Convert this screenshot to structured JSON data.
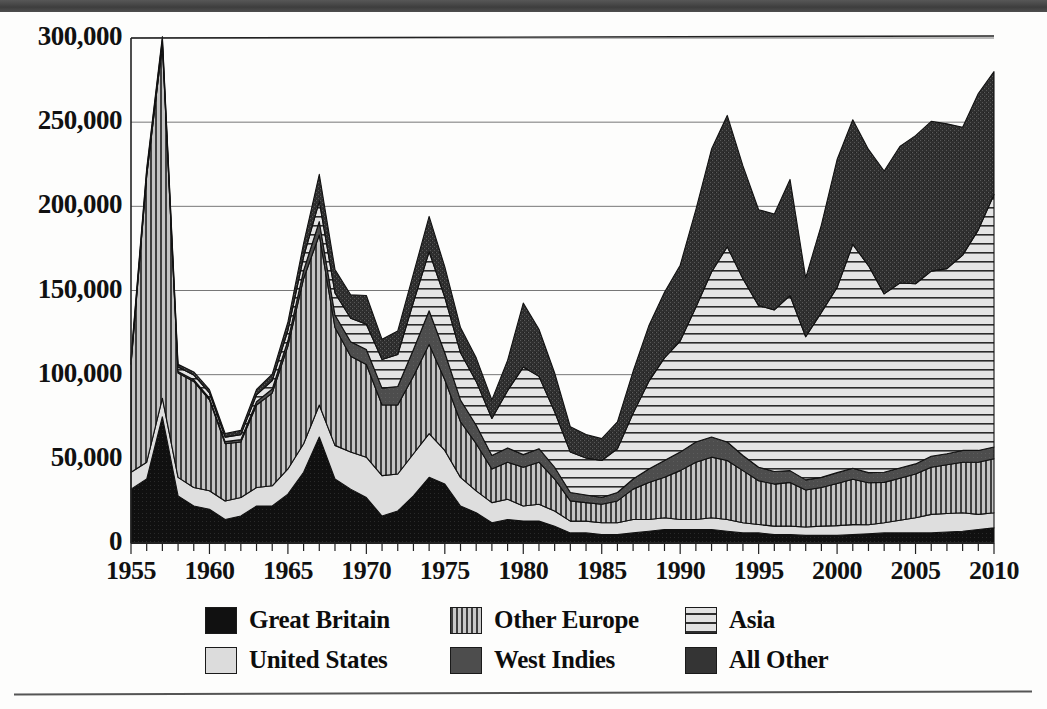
{
  "figure": {
    "banner_present": true,
    "background_color": "#fdfdfc",
    "accent_color": "#4a4a4a"
  },
  "chart_data": {
    "type": "area",
    "stacked": true,
    "title": "",
    "subtitle": "",
    "xlabel": "",
    "ylabel": "",
    "xlim": [
      1955,
      2010
    ],
    "ylim": [
      0,
      300000
    ],
    "grid": true,
    "grid_axis": "y",
    "legend_position": "bottom",
    "x_tick_labels": [
      "1955",
      "1960",
      "1965",
      "1970",
      "1975",
      "1980",
      "1985",
      "1990",
      "1995",
      "2000",
      "2005",
      "2010"
    ],
    "x_tick_step": 5,
    "minor_tick_step": 1,
    "y_tick_labels": [
      "0",
      "50,000",
      "100,000",
      "150,000",
      "200,000",
      "250,000",
      "300,000"
    ],
    "y_tick_values": [
      0,
      50000,
      100000,
      150000,
      200000,
      250000,
      300000
    ],
    "x": [
      1955,
      1956,
      1957,
      1958,
      1959,
      1960,
      1961,
      1962,
      1963,
      1964,
      1965,
      1966,
      1967,
      1968,
      1969,
      1970,
      1971,
      1972,
      1973,
      1974,
      1975,
      1976,
      1977,
      1978,
      1979,
      1980,
      1981,
      1982,
      1983,
      1984,
      1985,
      1986,
      1987,
      1988,
      1989,
      1990,
      1991,
      1992,
      1993,
      1994,
      1995,
      1996,
      1997,
      1998,
      1999,
      2000,
      2001,
      2002,
      2003,
      2004,
      2005,
      2006,
      2007,
      2008,
      2009,
      2010
    ],
    "series": [
      {
        "name": "Great Britain",
        "pattern": "solid-black",
        "color": "#111111",
        "values": [
          32000,
          38000,
          75000,
          28000,
          22000,
          20000,
          14000,
          16000,
          22000,
          22000,
          29000,
          42000,
          63000,
          38000,
          32000,
          27000,
          16000,
          19000,
          28000,
          39000,
          35000,
          22000,
          18000,
          12000,
          14000,
          13000,
          13000,
          10000,
          6000,
          6000,
          5000,
          5000,
          6000,
          7000,
          8000,
          8000,
          8000,
          8000,
          7000,
          6000,
          6000,
          5000,
          5000,
          4500,
          4500,
          4500,
          5000,
          5500,
          6000,
          6000,
          6000,
          6000,
          6500,
          7000,
          8000,
          9000
        ]
      },
      {
        "name": "United States",
        "pattern": "light-gray",
        "color": "#dcdcdc",
        "values": [
          10000,
          10000,
          11000,
          11000,
          11000,
          11000,
          11000,
          11000,
          11000,
          12000,
          15000,
          17000,
          19000,
          20000,
          22000,
          24000,
          24000,
          22000,
          25000,
          26000,
          20000,
          17000,
          13000,
          12000,
          12000,
          9000,
          10000,
          9000,
          7000,
          7000,
          7000,
          7000,
          8000,
          7000,
          7000,
          6000,
          6000,
          7000,
          7000,
          6000,
          5000,
          5000,
          5000,
          5000,
          5500,
          5800,
          5900,
          5300,
          6000,
          7500,
          9000,
          11000,
          11000,
          11000,
          9000,
          9000
        ]
      },
      {
        "name": "Other Europe",
        "pattern": "vertical-stripes",
        "color": "#8c8c8c",
        "values": [
          64000,
          170000,
          210000,
          62000,
          63000,
          54000,
          34000,
          33000,
          49000,
          55000,
          73000,
          98000,
          101000,
          70000,
          57000,
          55000,
          42000,
          41000,
          46000,
          53000,
          42000,
          33000,
          28000,
          20000,
          22000,
          23000,
          25000,
          19000,
          12000,
          11000,
          11000,
          13000,
          18000,
          22000,
          24000,
          29000,
          34000,
          36000,
          35000,
          31000,
          26000,
          25000,
          26000,
          22000,
          23000,
          25000,
          27000,
          25000,
          24000,
          25000,
          26000,
          28000,
          29000,
          30000,
          31000,
          32000
        ]
      },
      {
        "name": "West Indies",
        "pattern": "solid-dark-gray",
        "color": "#4d4d4d",
        "values": [
          600,
          700,
          800,
          900,
          1000,
          1100,
          1200,
          1400,
          2000,
          2500,
          3300,
          5000,
          8000,
          7500,
          8500,
          9000,
          10000,
          11000,
          16000,
          20000,
          16000,
          13000,
          11000,
          8000,
          8500,
          7500,
          8000,
          7000,
          5000,
          4500,
          4000,
          5000,
          6000,
          8000,
          10000,
          11000,
          12000,
          12000,
          11000,
          9000,
          8000,
          7500,
          7000,
          6000,
          6000,
          6500,
          6500,
          6000,
          6000,
          6000,
          6000,
          6500,
          6500,
          7000,
          7000,
          7000
        ]
      },
      {
        "name": "Asia",
        "pattern": "horizontal-stripes",
        "color": "#e2e2e2",
        "values": [
          2000,
          2200,
          2500,
          2600,
          2800,
          3000,
          2700,
          3000,
          4000,
          5000,
          6000,
          8000,
          12000,
          13000,
          14000,
          15000,
          17000,
          19000,
          28000,
          35000,
          33000,
          28000,
          26000,
          22000,
          34000,
          52000,
          43000,
          33000,
          24000,
          22000,
          22000,
          26000,
          39000,
          52000,
          61000,
          66000,
          80000,
          98000,
          116000,
          105000,
          96000,
          96000,
          104000,
          85000,
          98000,
          110000,
          133000,
          123000,
          106000,
          110000,
          107000,
          110000,
          110000,
          116000,
          131000,
          150000
        ]
      },
      {
        "name": "All Other",
        "pattern": "dark-speckle",
        "color": "#343434",
        "values": [
          1400,
          1500,
          1600,
          1700,
          1800,
          2000,
          2200,
          2500,
          3200,
          3800,
          5000,
          8000,
          16000,
          14000,
          14000,
          17000,
          12000,
          14000,
          17000,
          21000,
          18000,
          15000,
          14000,
          11000,
          18000,
          38000,
          28000,
          23000,
          15000,
          14000,
          13000,
          16000,
          25000,
          33000,
          39000,
          45000,
          58000,
          73000,
          78000,
          67000,
          57000,
          57000,
          69000,
          35000,
          52000,
          76000,
          74000,
          69000,
          73000,
          81000,
          88000,
          89000,
          86000,
          76000,
          81000,
          73000
        ]
      }
    ],
    "notable_points": [
      {
        "year": 1956,
        "total": 280000,
        "note": "peak"
      },
      {
        "year": 1962,
        "total": 71000,
        "note": "trough"
      },
      {
        "year": 1967,
        "total": 222000,
        "note": "peak"
      },
      {
        "year": 1974,
        "total": 218000,
        "note": "peak"
      },
      {
        "year": 1985,
        "total": 84000,
        "note": "trough"
      },
      {
        "year": 1993,
        "total": 256000,
        "note": "peak"
      },
      {
        "year": 1998,
        "total": 157000,
        "note": "trough"
      },
      {
        "year": 2010,
        "total": 288000,
        "note": "peak"
      }
    ]
  },
  "legend": {
    "items": [
      {
        "label": "Great Britain",
        "swatch_class": "sw-gb",
        "col": 0,
        "row": 0
      },
      {
        "label": "United States",
        "swatch_class": "sw-us",
        "col": 0,
        "row": 1
      },
      {
        "label": "Other Europe",
        "swatch_class": "sw-oe",
        "col": 1,
        "row": 0
      },
      {
        "label": "West Indies",
        "swatch_class": "sw-wi",
        "col": 1,
        "row": 1
      },
      {
        "label": "Asia",
        "swatch_class": "sw-as",
        "col": 2,
        "row": 0
      },
      {
        "label": "All Other",
        "swatch_class": "sw-ao",
        "col": 2,
        "row": 1
      }
    ]
  }
}
